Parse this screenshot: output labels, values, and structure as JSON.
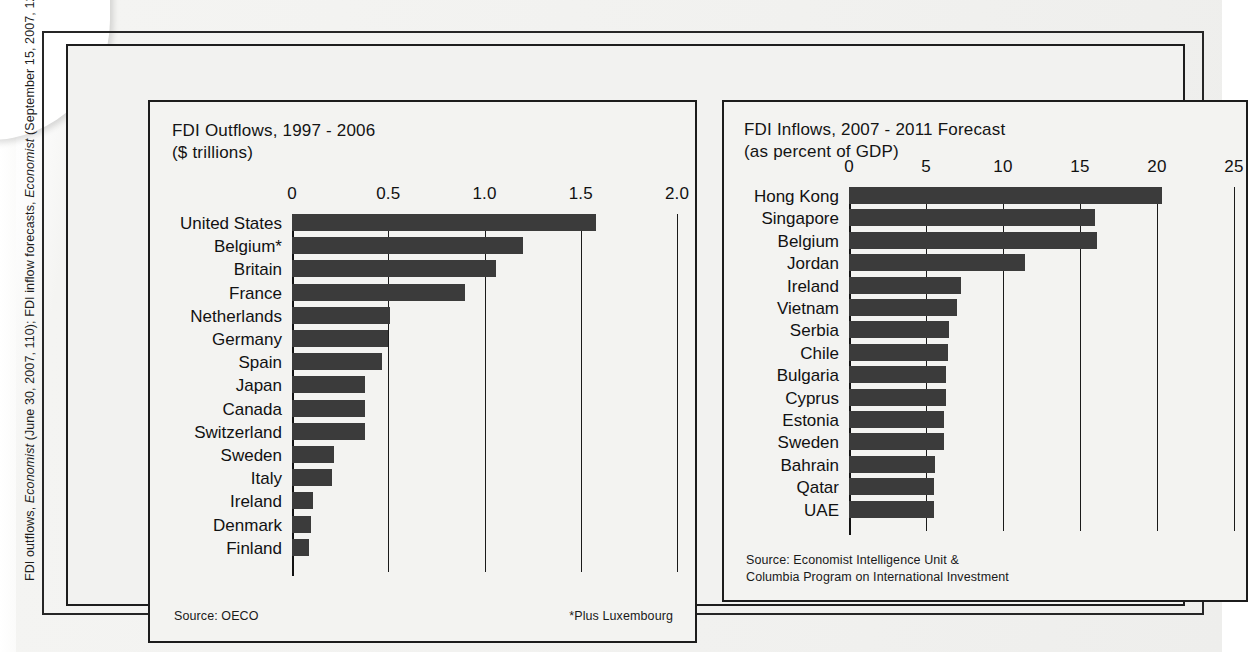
{
  "citation": "FDI outflows, Economist (June 30, 2007, 110); FDI inflow forecasts, Economist (September 15, 2007, 121).",
  "citation_parts": {
    "a": "FDI outflows, ",
    "b": "Economist",
    "c": " (June 30, 2007, 110); FDI inflow forecasts, ",
    "d": "Economist",
    "e": " (September 15, 2007, 121)."
  },
  "colors": {
    "bar": "#3b3b3b",
    "axis": "#1a1a1a",
    "panel_bg": "#f3f3f1",
    "frame": "#1c1c1c",
    "text": "#111111"
  },
  "left_panel": {
    "title": "FDI Outflows, 1997 - 2006\n($ trillions)",
    "source": "Source: OECO",
    "footnote": "*Plus Luxembourg"
  },
  "right_panel": {
    "title": "FDI Inflows, 2007 - 2011 Forecast\n(as percent of GDP)",
    "source": "Source: Economist Intelligence Unit &\nColumbia Program on International Investment"
  },
  "chart_data": [
    {
      "type": "bar",
      "orientation": "horizontal",
      "title": "FDI Outflows, 1997 - 2006",
      "subtitle": "($ trillions)",
      "xlabel": "$ trillions",
      "ylabel": "",
      "xlim": [
        0,
        2.0
      ],
      "xticks": [
        0,
        0.5,
        1.0,
        1.5,
        2.0
      ],
      "xtick_labels": [
        "0",
        "0.5",
        "1.0",
        "1.5",
        "2.0"
      ],
      "grid": "vertical gridlines at ticks",
      "legend": "none",
      "source": "Source: OECO",
      "annotation": "*Plus Luxembourg",
      "categories": [
        "United States",
        "Belgium*",
        "Britain",
        "France",
        "Netherlands",
        "Germany",
        "Spain",
        "Japan",
        "Canada",
        "Switzerland",
        "Sweden",
        "Italy",
        "Ireland",
        "Denmark",
        "Finland"
      ],
      "values": [
        1.58,
        1.2,
        1.06,
        0.9,
        0.51,
        0.5,
        0.47,
        0.38,
        0.38,
        0.38,
        0.22,
        0.21,
        0.11,
        0.1,
        0.09
      ]
    },
    {
      "type": "bar",
      "orientation": "horizontal",
      "title": "FDI Inflows, 2007 - 2011 Forecast",
      "subtitle": "(as percent of GDP)",
      "xlabel": "percent of GDP",
      "ylabel": "",
      "xlim": [
        0,
        25
      ],
      "xticks": [
        0,
        5,
        10,
        15,
        20,
        25
      ],
      "xtick_labels": [
        "0",
        "5",
        "10",
        "15",
        "20",
        "25"
      ],
      "grid": "vertical gridlines at ticks",
      "legend": "none",
      "source": "Source: Economist Intelligence Unit & Columbia Program on International Investment",
      "categories": [
        "Hong Kong",
        "Singapore",
        "Belgium",
        "Jordan",
        "Ireland",
        "Vietnam",
        "Serbia",
        "Chile",
        "Bulgaria",
        "Cyprus",
        "Estonia",
        "Sweden",
        "Bahrain",
        "Qatar",
        "UAE"
      ],
      "values": [
        20.3,
        16.0,
        16.1,
        11.4,
        7.3,
        7.0,
        6.5,
        6.4,
        6.3,
        6.3,
        6.2,
        6.2,
        5.6,
        5.5,
        5.5
      ]
    }
  ]
}
